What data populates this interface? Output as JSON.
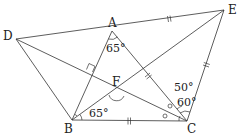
{
  "diagram": {
    "type": "geometry",
    "points": {
      "A": {
        "label": "A",
        "x": 112,
        "y": 31
      },
      "B": {
        "label": "B",
        "x": 72,
        "y": 120
      },
      "C": {
        "label": "C",
        "x": 187,
        "y": 121
      },
      "D": {
        "label": "D",
        "x": 16,
        "y": 39
      },
      "E": {
        "label": "E",
        "x": 224,
        "y": 10
      },
      "F": {
        "label": "F",
        "x": 117,
        "y": 92
      }
    },
    "angles": {
      "A": "65°",
      "B": "65°",
      "C_upper": "50°",
      "C_lower": "60°"
    },
    "marks": {
      "equal_segments": [
        "AE",
        "CE",
        "AC",
        "BC"
      ],
      "right_angle_at": "intersection of AB and DC",
      "equal_small_angles": [
        "circle mark at C",
        "circle mark at C"
      ]
    }
  }
}
